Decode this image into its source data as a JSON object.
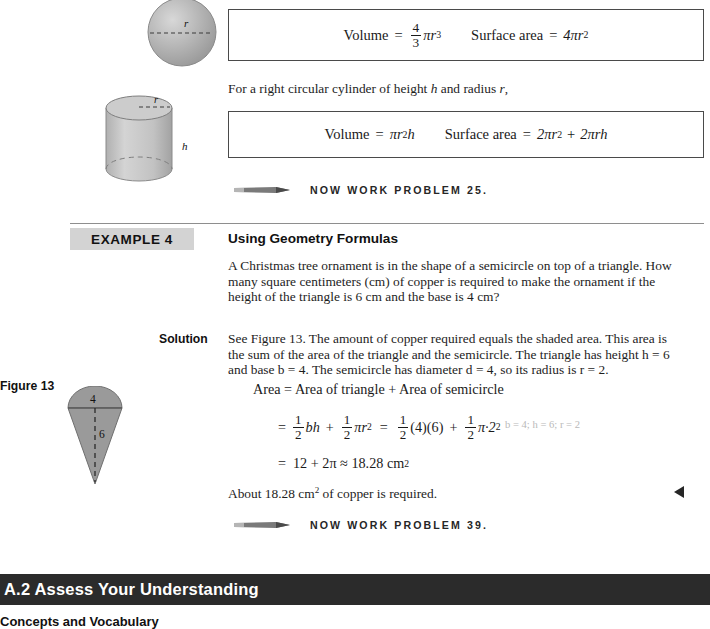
{
  "page": {
    "width": 710,
    "height": 625,
    "background": "#ffffff"
  },
  "sphere_block": {
    "shape_label_r": "r",
    "formula": {
      "volume_label": "Volume",
      "equals": "=",
      "volume_frac_num": "4",
      "volume_frac_den": "3",
      "volume_pi_r": "πr",
      "volume_exp": "3",
      "surface_label": "Surface area",
      "surface_equals": "=",
      "surface_expr": "4πr",
      "surface_exp": "2"
    }
  },
  "cylinder_block": {
    "intro": "For a right circular cylinder of height h and radius r,",
    "intro_parts": {
      "before_h": "For a right circular cylinder of height ",
      "h": "h",
      "between": " and radius ",
      "r": "r",
      "after": ","
    },
    "shape_label_r": "r",
    "shape_label_h": "h",
    "formula": {
      "volume_label": "Volume",
      "equals": "=",
      "volume_expr": "πr",
      "volume_exp": "2",
      "volume_tail": "h",
      "surface_label": "Surface area",
      "surface_equals": "=",
      "surface_term1": "2πr",
      "surface_term1_exp": "2",
      "surface_plus": "+",
      "surface_term2": "2πrh"
    }
  },
  "now_work_1": {
    "icon": "pencil-icon",
    "text": "NOW WORK PROBLEM 25."
  },
  "example": {
    "tag": "EXAMPLE 4",
    "title": "Using Geometry Formulas",
    "problem_lines": [
      "A Christmas tree ornament is in the shape of a semicircle on top of a triangle. How",
      "many square centimeters (cm) of copper is required to make the ornament if the",
      "height of the triangle is 6 cm and the base is 4 cm?"
    ],
    "solution_label": "Solution",
    "solution_lines": [
      "See Figure 13. The amount of copper required equals the shaded area. This area is",
      "the sum of the area of the triangle and the semicircle. The triangle has height h = 6",
      "and base b = 4. The semicircle has diameter d = 4, so its radius is r = 2."
    ],
    "math": {
      "line1": "Area  =  Area of triangle  +  Area of semicircle",
      "line2": {
        "equals": "=",
        "frac1_num": "1",
        "frac1_den": "2",
        "term1": "bh",
        "plus1": "+",
        "frac2_num": "1",
        "frac2_den": "2",
        "term2": "πr",
        "term2_exp": "2",
        "equals2": "=",
        "frac3_num": "1",
        "frac3_den": "2",
        "term3": "(4)(6)",
        "plus2": "+",
        "frac4_num": "1",
        "frac4_den": "2",
        "term4": "π·2",
        "term4_exp": "2"
      },
      "annotation": "b = 4; h = 6; r = 2",
      "line3": {
        "equals": "=",
        "value": "12  +  2π  ≈  18.28 cm",
        "exp": "2"
      }
    },
    "conclusion": {
      "before": "About 18.28 cm",
      "exp": "2",
      "after": " of copper is required."
    },
    "end_marker": "solution-end-triangle"
  },
  "figure": {
    "label": "Figure 13",
    "top_dimension": "4",
    "height_dimension": "6",
    "fill_color": "#9a9a9a"
  },
  "now_work_2": {
    "icon": "pencil-icon",
    "text": "NOW WORK PROBLEM 39."
  },
  "section": {
    "bar_title": "A.2 Assess Your Understanding",
    "bar_color": "#2b2b2b",
    "subsection_title": "Concepts and Vocabulary"
  }
}
